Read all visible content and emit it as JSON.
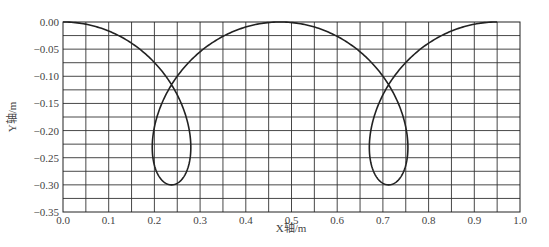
{
  "chart_data": {
    "type": "line",
    "title": "",
    "xlabel": "X轴/m",
    "ylabel": "Y轴/m",
    "xlim": [
      0.0,
      1.0
    ],
    "ylim": [
      -0.35,
      0.0
    ],
    "grid": true,
    "x_ticks": [
      "0.0",
      "0.1",
      "0.2",
      "0.3",
      "0.4",
      "0.5",
      "0.6",
      "0.7",
      "0.8",
      "0.9",
      "1.0"
    ],
    "y_ticks": [
      "0.00",
      "-0.05",
      "-0.10",
      "-0.15",
      "-0.20",
      "-0.25",
      "-0.30",
      "-0.35"
    ],
    "x_grid_step": 0.05,
    "y_grid_step": 0.025,
    "legend": null,
    "series": [
      {
        "name": "trajectory",
        "description": "Prolate-cycloid-like path with two loops; starts at (0,0), loops near x≈0.24 (bottom y≈-0.30), peaks at (0.475,0), loops near x≈0.71, ends at (0.95,0)",
        "points": [
          [
            0.0,
            0.0
          ],
          [
            0.024,
            -0.002
          ],
          [
            0.048,
            -0.008
          ],
          [
            0.071,
            -0.017
          ],
          [
            0.093,
            -0.03
          ],
          [
            0.114,
            -0.046
          ],
          [
            0.133,
            -0.065
          ],
          [
            0.151,
            -0.086
          ],
          [
            0.167,
            -0.108
          ],
          [
            0.18,
            -0.131
          ],
          [
            0.191,
            -0.154
          ],
          [
            0.199,
            -0.177
          ],
          [
            0.205,
            -0.199
          ],
          [
            0.208,
            -0.22
          ],
          [
            0.209,
            -0.239
          ],
          [
            0.208,
            -0.256
          ],
          [
            0.205,
            -0.271
          ],
          [
            0.201,
            -0.283
          ],
          [
            0.195,
            -0.292
          ],
          [
            0.189,
            -0.298
          ],
          [
            0.184,
            -0.3
          ]
        ]
      }
    ],
    "curve_model": {
      "form": "x = R*t + d*sin(t), y = -h*(1 - cos(t))/2",
      "R": 0.0756,
      "d": 0.14,
      "h": 0.3,
      "t_range": [
        0,
        12.566
      ]
    },
    "key_points": {
      "loop1_crossing": [
        0.24,
        -0.1
      ],
      "loop1_bottom": [
        0.237,
        -0.3
      ],
      "loop1_x_extent": [
        0.19,
        0.285
      ],
      "arc_peak": [
        0.475,
        0.0
      ],
      "loop2_crossing": [
        0.71,
        -0.1
      ],
      "loop2_bottom": [
        0.712,
        -0.3
      ],
      "loop2_x_extent": [
        0.66,
        0.76
      ],
      "end": [
        0.95,
        0.0
      ]
    }
  }
}
